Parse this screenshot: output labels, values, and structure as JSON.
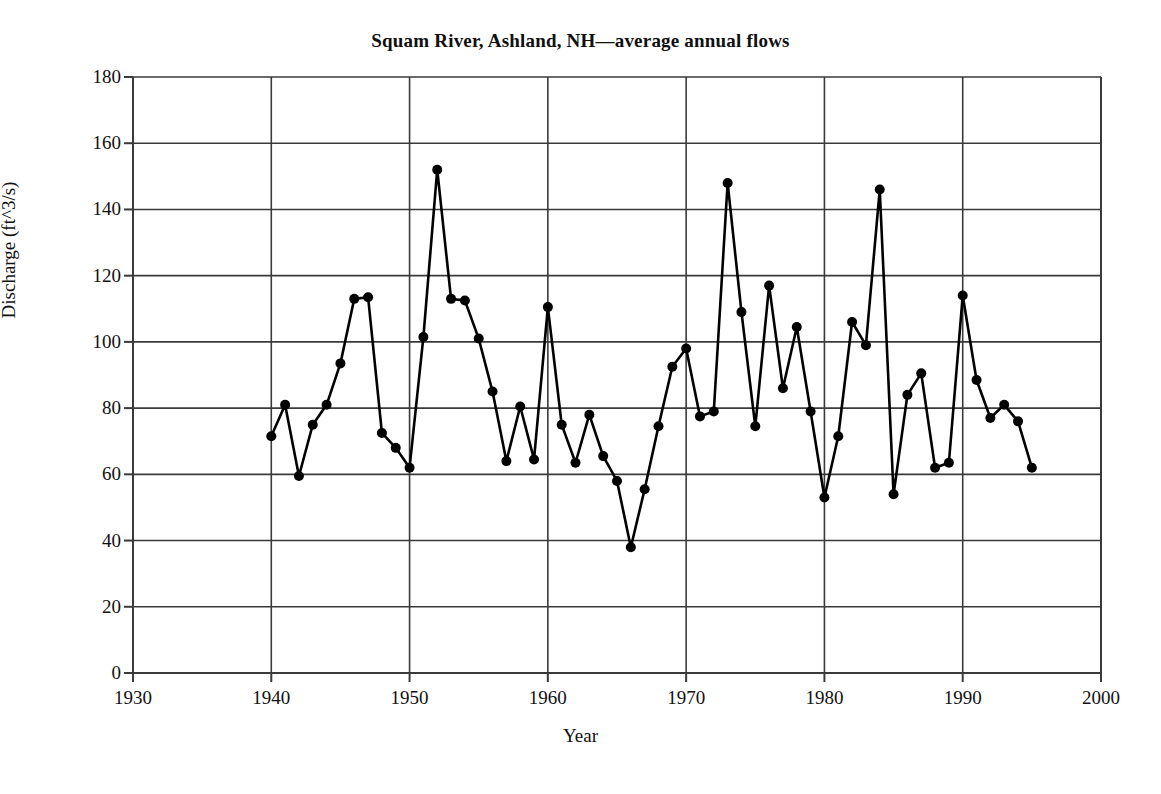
{
  "chart_data": {
    "type": "line",
    "title": "Squam River, Ashland, NH—average annual flows",
    "xlabel": "Year",
    "ylabel": "Discharge (ft^3/s)",
    "xlim": [
      1930,
      2000
    ],
    "ylim": [
      0,
      180
    ],
    "xticks": [
      1930,
      1940,
      1950,
      1960,
      1970,
      1980,
      1990,
      2000
    ],
    "yticks": [
      0,
      20,
      40,
      60,
      80,
      100,
      120,
      140,
      160,
      180
    ],
    "grid": "both-axes-major-gridlines",
    "legend": "none",
    "marker": "filled-circle",
    "line_color": "#000000",
    "marker_color": "#000000",
    "grid_color": "#3a3a3a",
    "background_color": "#ffffff",
    "x": [
      1940,
      1941,
      1942,
      1943,
      1944,
      1945,
      1946,
      1947,
      1948,
      1949,
      1950,
      1951,
      1952,
      1953,
      1954,
      1955,
      1956,
      1957,
      1958,
      1959,
      1960,
      1961,
      1962,
      1963,
      1964,
      1965,
      1966,
      1967,
      1968,
      1969,
      1970,
      1971,
      1972,
      1973,
      1974,
      1975,
      1976,
      1977,
      1978,
      1979,
      1980,
      1981,
      1982,
      1983,
      1984,
      1985,
      1986,
      1987,
      1988,
      1989,
      1990,
      1991,
      1992,
      1993,
      1994,
      1995
    ],
    "values": [
      71.5,
      81.0,
      59.5,
      75.0,
      81.0,
      93.5,
      113.0,
      113.5,
      72.5,
      68.0,
      62.0,
      101.5,
      152.0,
      113.0,
      112.5,
      101.0,
      85.0,
      64.0,
      80.5,
      64.5,
      110.5,
      75.0,
      63.5,
      78.0,
      65.5,
      58.0,
      38.0,
      55.5,
      74.5,
      92.5,
      98.0,
      77.5,
      79.0,
      148.0,
      109.0,
      74.5,
      117.0,
      86.0,
      104.5,
      79.0,
      53.0,
      71.5,
      106.0,
      99.0,
      146.0,
      54.0,
      84.0,
      90.5,
      62.0,
      63.5,
      114.0,
      88.5,
      77.0,
      81.0,
      76.0,
      62.0
    ],
    "series_name": "average annual discharge",
    "n_points": 56,
    "min_value": 38.0,
    "min_year": 1966,
    "max_value": 152.0,
    "max_year": 1952
  }
}
